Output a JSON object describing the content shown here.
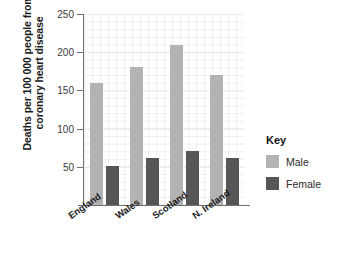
{
  "chart_data": {
    "type": "bar",
    "title": "",
    "subtitle": "",
    "xlabel": "",
    "ylabel_lines": [
      "Deaths per 100 000 people from",
      "coronary heart disease"
    ],
    "ylabel": "Deaths per 100 000 people from coronary heart disease",
    "categories": [
      "England",
      "Wales",
      "Scotland",
      "N. Ireland"
    ],
    "series": [
      {
        "name": "Male",
        "color": "#b3b3b3",
        "values": [
          160,
          180,
          210,
          170
        ]
      },
      {
        "name": "Female",
        "color": "#565656",
        "values": [
          51,
          61,
          71,
          61
        ]
      }
    ],
    "ylim": [
      0,
      250
    ],
    "yticks": [
      0,
      50,
      100,
      150,
      200,
      250
    ],
    "ytick_labels": [
      "",
      "50",
      "100",
      "150",
      "200",
      "250"
    ],
    "grid": true,
    "minor_grid": true,
    "legend_position": "right"
  },
  "legend": {
    "title": "Key",
    "entries": [
      {
        "label": "Male",
        "color": "#b3b3b3"
      },
      {
        "label": "Female",
        "color": "#565656"
      }
    ]
  },
  "colors": {
    "male": "#b3b3b3",
    "female": "#565656",
    "axis": "#6f6f6f",
    "grid_major": "#e2e2e2",
    "grid_minor": "#efefef",
    "text": "#1b1b1b",
    "background": "#ffffff"
  }
}
